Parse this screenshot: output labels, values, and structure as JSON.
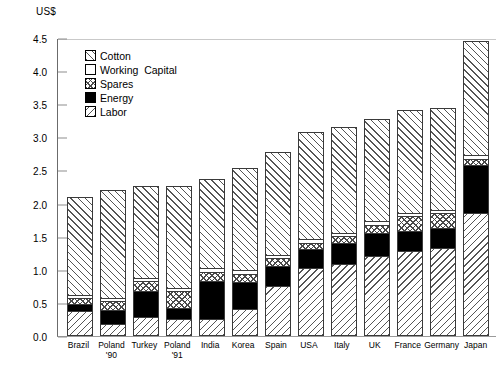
{
  "chart_data": {
    "type": "bar",
    "title": "",
    "subtitle": "",
    "xlabel": "",
    "ylabel": "US$",
    "ylim": [
      0,
      4.5
    ],
    "ytick_labels": [
      "0.0",
      "0.5",
      "1.0",
      "1.5",
      "2.0",
      "2.5",
      "3.0",
      "3.5",
      "4.0",
      "4.5"
    ],
    "ytick_values": [
      0.0,
      0.5,
      1.0,
      1.5,
      2.0,
      2.5,
      3.0,
      3.5,
      4.0,
      4.5
    ],
    "grid": false,
    "stacked": true,
    "legend_position": "inside-upper-left",
    "categories": [
      "Brazil",
      "Poland '90",
      "Turkey",
      "Poland '91",
      "India",
      "Korea",
      "Spain",
      "USA",
      "Italy",
      "UK",
      "France",
      "Germany",
      "Japan"
    ],
    "category_lines": [
      [
        "Brazil"
      ],
      [
        "Poland",
        "'90"
      ],
      [
        "Turkey"
      ],
      [
        "Poland",
        "'91"
      ],
      [
        "India"
      ],
      [
        "Korea"
      ],
      [
        "Spain"
      ],
      [
        "USA"
      ],
      [
        "Italy"
      ],
      [
        "UK"
      ],
      [
        "France"
      ],
      [
        "Germany"
      ],
      [
        "Japan"
      ]
    ],
    "series": [
      {
        "name": "Labor",
        "values": [
          0.35,
          0.15,
          0.25,
          0.22,
          0.22,
          0.38,
          0.72,
          1.0,
          1.05,
          1.18,
          1.25,
          1.3,
          1.82
        ]
      },
      {
        "name": "Energy",
        "values": [
          0.1,
          0.22,
          0.4,
          0.18,
          0.58,
          0.4,
          0.3,
          0.28,
          0.33,
          0.34,
          0.3,
          0.3,
          0.73
        ]
      },
      {
        "name": "Spares",
        "values": [
          0.1,
          0.13,
          0.15,
          0.25,
          0.14,
          0.12,
          0.13,
          0.1,
          0.1,
          0.13,
          0.23,
          0.23,
          0.1
        ]
      },
      {
        "name": "Working Capital",
        "values": [
          0.04,
          0.04,
          0.05,
          0.05,
          0.06,
          0.06,
          0.05,
          0.05,
          0.05,
          0.05,
          0.05,
          0.05,
          0.05
        ]
      },
      {
        "name": "Cotton",
        "values": [
          1.48,
          1.63,
          1.39,
          1.54,
          1.34,
          1.55,
          1.55,
          1.62,
          1.59,
          1.55,
          1.55,
          1.54,
          1.72
        ]
      }
    ],
    "totals": [
      2.07,
      2.17,
      2.24,
      2.24,
      2.34,
      2.51,
      2.75,
      3.05,
      3.12,
      3.25,
      3.38,
      3.42,
      4.42
    ]
  },
  "legend": {
    "items": [
      {
        "label": "Cotton",
        "pattern": "p-cotton"
      },
      {
        "label": "Working  Capital",
        "pattern": "p-working"
      },
      {
        "label": "Spares",
        "pattern": "p-spares"
      },
      {
        "label": "Energy",
        "pattern": "p-energy"
      },
      {
        "label": "Labor",
        "pattern": "p-labor"
      }
    ]
  }
}
